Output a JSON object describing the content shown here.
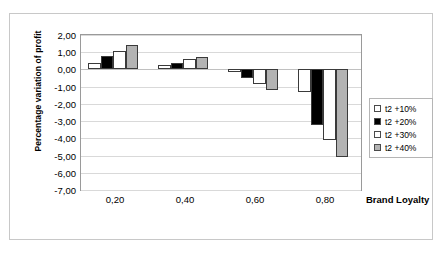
{
  "chart_data": {
    "type": "bar",
    "title": "",
    "xlabel": "Brand Loyalty",
    "ylabel": "Percentage variation of profit",
    "categories": [
      "0,20",
      "0,40",
      "0,60",
      "0,80"
    ],
    "ylim": [
      -7.0,
      2.0
    ],
    "ytick_labels": [
      "2,00",
      "1,00",
      "0,00",
      "-1,00",
      "-2,00",
      "-3,00",
      "-4,00",
      "-5,00",
      "-6,00",
      "-7,00"
    ],
    "ytick_values": [
      2.0,
      1.0,
      0.0,
      -1.0,
      -2.0,
      -3.0,
      -4.0,
      -5.0,
      -6.0,
      -7.0
    ],
    "grid": true,
    "legend_position": "right",
    "series": [
      {
        "name": "t2 +10%",
        "color": "#ffffff",
        "values": [
          0.4,
          0.25,
          -0.15,
          -1.3
        ]
      },
      {
        "name": "t2 +20%",
        "color": "#000000",
        "values": [
          0.8,
          0.4,
          -0.5,
          -3.2
        ]
      },
      {
        "name": "t2 +30%",
        "color": "#ffffff",
        "values": [
          1.1,
          0.6,
          -0.85,
          -4.1
        ]
      },
      {
        "name": "t2 +40%",
        "color": "#b3b3b3",
        "values": [
          1.4,
          0.7,
          -1.2,
          -5.1
        ]
      }
    ]
  }
}
